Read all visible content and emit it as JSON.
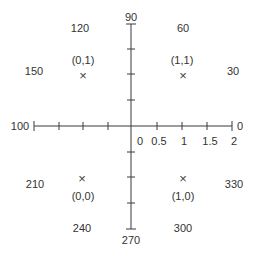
{
  "diagram": {
    "type": "polar-angle-reference-with-unit-square-points",
    "horizontal_axis": {
      "left_end_label": "100",
      "right_end_label": "0",
      "tick_labels": [
        "0",
        "0.5",
        "1",
        "1.5",
        "2"
      ]
    },
    "vertical_axis": {
      "top_label": "90",
      "bottom_label": "270"
    },
    "angle_labels": {
      "a30": "30",
      "a60": "60",
      "a120": "120",
      "a150": "150",
      "a210": "210",
      "a240": "240",
      "a300": "300",
      "a330": "330"
    },
    "points": [
      {
        "label": "(0,1)",
        "marker": "×"
      },
      {
        "label": "(1,1)",
        "marker": "×"
      },
      {
        "label": "(0,0)",
        "marker": "×"
      },
      {
        "label": "(1,0)",
        "marker": "×"
      }
    ],
    "colors": {
      "line": "#333333",
      "text": "#333333",
      "background": "#ffffff"
    }
  }
}
